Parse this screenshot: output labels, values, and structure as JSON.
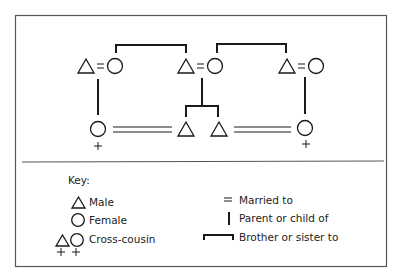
{
  "diagram": {
    "type": "kinship",
    "colors": {
      "line": "#1a1a1a",
      "border": "#555555",
      "background": "#ffffff"
    }
  },
  "generations": [
    {
      "level": "parents",
      "couples": [
        {
          "husband": "male",
          "wife": "female",
          "relation": "="
        },
        {
          "husband": "male",
          "wife": "female",
          "relation": "="
        },
        {
          "husband": "male",
          "wife": "female",
          "relation": "="
        }
      ],
      "sibling_links": [
        {
          "from": "couple-1-wife",
          "to": "couple-2-husband"
        },
        {
          "from": "couple-2-wife",
          "to": "couple-3-husband"
        }
      ]
    },
    {
      "level": "children",
      "individuals": [
        {
          "sex": "female",
          "marker": "+",
          "parent": "couple-1"
        },
        {
          "sex": "male",
          "marker": "",
          "parent": "couple-2"
        },
        {
          "sex": "male",
          "marker": "",
          "parent": "couple-2"
        },
        {
          "sex": "female",
          "marker": "+",
          "parent": "couple-3"
        }
      ],
      "marriages": [
        {
          "from": "child-1",
          "to": "child-2",
          "relation": "="
        },
        {
          "from": "child-3",
          "to": "child-4",
          "relation": "="
        }
      ]
    }
  ],
  "key": {
    "heading": "Key:",
    "items": [
      {
        "symbol": "triangle",
        "label": "Male"
      },
      {
        "symbol": "circle",
        "label": "Female"
      },
      {
        "symbol": "triangle-circle-plus",
        "label": "Cross-cousin"
      },
      {
        "symbol": "equals",
        "label": "Married to"
      },
      {
        "symbol": "vertical-line",
        "label": "Parent or child of"
      },
      {
        "symbol": "bracket",
        "label": "Brother or sister to"
      }
    ]
  },
  "plus_marker": "+",
  "equals_marker": "="
}
